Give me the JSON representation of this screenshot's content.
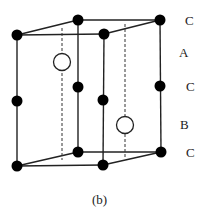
{
  "figure": {
    "caption": "(b)",
    "layer_labels": [
      {
        "id": "c-top",
        "text": "C"
      },
      {
        "id": "a",
        "text": "A"
      },
      {
        "id": "c-mid",
        "text": "C"
      },
      {
        "id": "b",
        "text": "B"
      },
      {
        "id": "c-bottom",
        "text": "C"
      }
    ],
    "atom_color": "#000000",
    "interstitial_fill": "#ffffff"
  }
}
